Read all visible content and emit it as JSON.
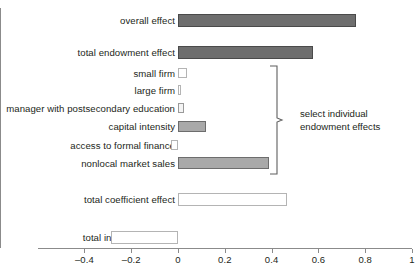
{
  "chart_data": {
    "type": "bar",
    "orientation": "horizontal",
    "title": "",
    "subtitle": "",
    "xlabel": "",
    "ylabel": "",
    "xlim": [
      -0.4,
      1.0
    ],
    "xticks": [
      -0.4,
      -0.2,
      0,
      0.2,
      0.4,
      0.6,
      0.8,
      1
    ],
    "xtick_labels": [
      "–0.4",
      "–0.2",
      "0",
      "0.2",
      "0.4",
      "0.6",
      "0.8",
      "1"
    ],
    "grid": false,
    "legend": "none",
    "categories": [
      "overall effect",
      "total endowment effect",
      "small firm",
      "large firm",
      "manager with postsecondary education",
      "capital intensity",
      "access to formal finance",
      "nonlocal market sales",
      "total coefficient effect",
      "total interaction effect"
    ],
    "values": [
      0.76,
      0.575,
      0.04,
      0.005,
      0.025,
      0.12,
      -0.03,
      0.39,
      0.465,
      -0.285
    ],
    "bar_styles": [
      "dark",
      "dark",
      "open",
      "open",
      "light",
      "mid",
      "open",
      "mid",
      "open",
      "open"
    ],
    "annotations": [
      {
        "text_line1": "select individual",
        "text_line2": "endowment effects",
        "covers_categories": [
          "small firm",
          "large firm",
          "manager with postsecondary education",
          "capital intensity",
          "access to formal finance",
          "nonlocal market sales"
        ]
      }
    ]
  },
  "axis": {
    "tick_labels": [
      "–0.4",
      "–0.2",
      "0",
      "0.2",
      "0.4",
      "0.6",
      "0.8",
      "1"
    ]
  },
  "rows": [
    {
      "label": "overall effect"
    },
    {
      "label": "total endowment effect"
    },
    {
      "label": "small firm"
    },
    {
      "label": "large firm"
    },
    {
      "label": "manager with postsecondary education"
    },
    {
      "label": "capital intensity"
    },
    {
      "label": "access to formal finance"
    },
    {
      "label": "nonlocal market sales"
    },
    {
      "label": "total coefficient effect"
    },
    {
      "label": "total interaction effect"
    }
  ],
  "annotation": {
    "line1": "select individual",
    "line2": "endowment effects"
  },
  "colors": {
    "bar_dark": "#6e6e6e",
    "bar_mid": "#a9a9a9",
    "bar_light": "#f4f4f4",
    "bar_open": "#ffffff",
    "axis": "#8b8b8b",
    "text": "#231f20"
  }
}
